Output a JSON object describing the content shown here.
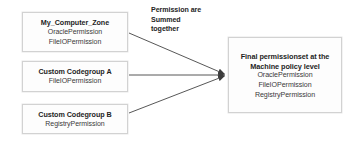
{
  "diagram": {
    "title_annotation": {
      "lines": [
        "Permission are",
        "Summed",
        "together"
      ]
    },
    "source_nodes": [
      {
        "id": "my-computer-zone",
        "title": "My_Computer_Zone",
        "permissions": [
          "OraclePermission",
          "FileIOPermission"
        ]
      },
      {
        "id": "custom-codegroup-a",
        "title": "Custom Codegroup A",
        "permissions": [
          "FileIOPermission"
        ]
      },
      {
        "id": "custom-codegroup-b",
        "title": "Custom Codegroup B",
        "permissions": [
          "RegistryPermission"
        ]
      }
    ],
    "target_node": {
      "id": "final-permissionset",
      "title_line_1": "Final permissionset at the",
      "title_line_2": "Machine policy level",
      "permissions": [
        "OraclePermission",
        "FileIOPermission",
        "RegistryPermission"
      ]
    },
    "colors": {
      "box_border": "#d2d2d2",
      "box_fill": "#fdfdfd",
      "arrow": "#444444",
      "text": "#2b2b2b"
    },
    "arrows": [
      {
        "from": "my-computer-zone",
        "to": "final-permissionset"
      },
      {
        "from": "custom-codegroup-a",
        "to": "final-permissionset"
      },
      {
        "from": "custom-codegroup-b",
        "to": "final-permissionset"
      }
    ]
  }
}
